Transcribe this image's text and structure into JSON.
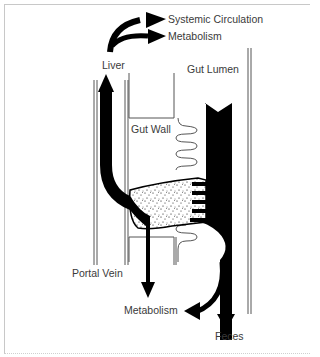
{
  "diagram": {
    "type": "first-pass-metabolism",
    "labels": {
      "systemic_circulation": "Systemic Circulation",
      "metabolism_liver": "Metabolism",
      "liver": "Liver",
      "gut_lumen": "Gut Lumen",
      "gut_wall": "Gut Wall",
      "portal_vein": "Portal Vein",
      "metabolism_gut": "Metabolism",
      "feces": "Feces"
    },
    "colors": {
      "ink": "#000000",
      "line": "#555555",
      "text": "#3a3a3a",
      "frame": "#c8c8c8",
      "background": "#ffffff"
    }
  }
}
